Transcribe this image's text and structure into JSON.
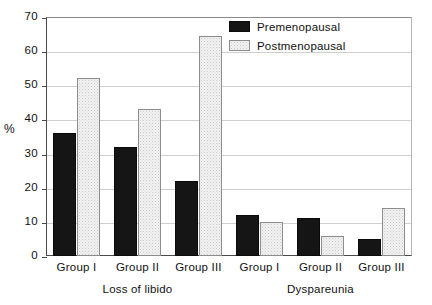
{
  "chart_data": {
    "type": "bar",
    "title": "",
    "xlabel": "",
    "ylabel": "%",
    "ylim": [
      0,
      70
    ],
    "ytick_step": 10,
    "yticks": [
      70,
      60,
      50,
      40,
      30,
      20,
      10,
      0
    ],
    "grid": true,
    "legend_position": "top-right",
    "categories": [
      "Group I",
      "Group II",
      "Group III",
      "Group I",
      "Group II",
      "Group III"
    ],
    "category_groups": [
      {
        "label": "Loss of libido",
        "categories": [
          "Group I",
          "Group II",
          "Group III"
        ]
      },
      {
        "label": "Dyspareunia",
        "categories": [
          "Group I",
          "Group II",
          "Group III"
        ]
      }
    ],
    "series": [
      {
        "name": "Premenopausal",
        "values": [
          36,
          32,
          22,
          12,
          11,
          5
        ],
        "color": "#151515",
        "pattern": "solid"
      },
      {
        "name": "Postmenopausal",
        "values": [
          52,
          43,
          64.5,
          10,
          6,
          14
        ],
        "color": "#f2f2f2",
        "pattern": "dotted"
      }
    ]
  },
  "legend": {
    "items": [
      {
        "label": "Premenopausal"
      },
      {
        "label": "Postmenopausal"
      }
    ]
  },
  "axis": {
    "y_title": "%"
  }
}
